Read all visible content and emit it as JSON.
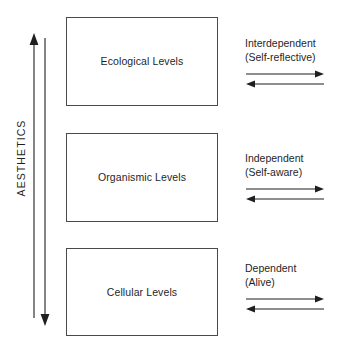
{
  "diagram": {
    "axis": {
      "label": "AESTHETICS",
      "up_arrow_name": "aesthetics-up-arrow",
      "down_arrow_name": "aesthetics-down-arrow"
    },
    "levels": [
      {
        "label": "Ecological Levels"
      },
      {
        "label": "Organismic Levels"
      },
      {
        "label": "Cellular Levels"
      }
    ],
    "relations": [
      {
        "title": "Interdependent",
        "subtitle": "(Self-reflective)"
      },
      {
        "title": "Independent",
        "subtitle": "(Self-aware)"
      },
      {
        "title": "Dependent",
        "subtitle": "(Alive)"
      }
    ],
    "colors": {
      "stroke": "#1f1f1f",
      "box_border": "#4a4a4a",
      "background": "#ffffff"
    }
  }
}
